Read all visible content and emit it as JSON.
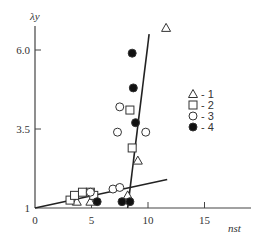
{
  "chart_data": {
    "type": "scatter",
    "title": "",
    "xlabel": "n_st",
    "ylabel": "λ_y",
    "xlim": [
      0,
      18
    ],
    "ylim": [
      1,
      6.8
    ],
    "x_ticks": [
      "0",
      "5",
      "10",
      "15"
    ],
    "x_tick_values": [
      0,
      5,
      10,
      15
    ],
    "y_ticks": [
      "1",
      "3.5",
      "6.0"
    ],
    "y_tick_values": [
      1,
      3.5,
      6.0
    ],
    "grid": false,
    "legend_position": "right",
    "series": [
      {
        "name": "1",
        "marker": "triangle-open",
        "points": [
          [
            11.6,
            6.7
          ],
          [
            9.1,
            2.5
          ],
          [
            3.7,
            1.2
          ],
          [
            4.9,
            1.2
          ],
          [
            8.2,
            1.4
          ]
        ]
      },
      {
        "name": "2",
        "marker": "square-open",
        "points": [
          [
            3.1,
            1.25
          ],
          [
            3.5,
            1.4
          ],
          [
            4.2,
            1.5
          ],
          [
            4.9,
            1.5
          ],
          [
            5.2,
            1.4
          ],
          [
            8.4,
            4.1
          ],
          [
            8.6,
            2.9
          ]
        ]
      },
      {
        "name": "3",
        "marker": "circle-open",
        "points": [
          [
            7.5,
            4.2
          ],
          [
            7.3,
            3.4
          ],
          [
            9.8,
            3.4
          ],
          [
            6.9,
            1.6
          ],
          [
            7.5,
            1.65
          ],
          [
            4.9,
            1.5
          ]
        ]
      },
      {
        "name": "4",
        "marker": "circle-filled",
        "points": [
          [
            8.6,
            5.9
          ],
          [
            8.7,
            4.8
          ],
          [
            8.9,
            3.7
          ],
          [
            5.5,
            1.2
          ],
          [
            7.7,
            1.2
          ],
          [
            8.4,
            1.2
          ]
        ]
      }
    ],
    "lines": [
      {
        "name": "low-slope fit",
        "points": [
          [
            0,
            1.0
          ],
          [
            11.7,
            1.9
          ]
        ]
      },
      {
        "name": "steep fit",
        "points": [
          [
            8.2,
            1.0
          ],
          [
            10.1,
            6.5
          ]
        ]
      }
    ]
  },
  "axes": {
    "y_title": "λy",
    "x_title": "nst"
  },
  "legend": [
    {
      "marker": "triangle-open",
      "label": "- 1"
    },
    {
      "marker": "square-open",
      "label": "- 2"
    },
    {
      "marker": "circle-open",
      "label": "- 3"
    },
    {
      "marker": "circle-filled",
      "label": "- 4"
    }
  ]
}
